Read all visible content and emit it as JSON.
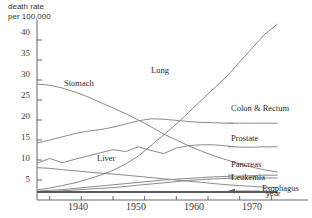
{
  "chart_data": {
    "type": "line",
    "title": "",
    "ylabel": "death rate\nper 100,000",
    "xlabel": "year",
    "xlim": [
      1933,
      1972
    ],
    "ylim": [
      0,
      44
    ],
    "grid": false,
    "legend_position": "inline-right",
    "yticks": [
      5,
      10,
      15,
      20,
      25,
      30,
      35,
      40
    ],
    "ytick_labels": [
      "5",
      "10",
      "15",
      "20",
      "25",
      "30",
      "35",
      "40"
    ],
    "xticks": [
      1935,
      1940,
      1945,
      1950,
      1955,
      1960,
      1965,
      1970
    ],
    "xtick_labels": [
      "",
      "1940",
      "",
      "1950",
      "",
      "1960",
      "",
      "1970"
    ],
    "x": [
      1933,
      1935,
      1937,
      1939,
      1941,
      1943,
      1945,
      1947,
      1949,
      1951,
      1953,
      1955,
      1957,
      1959,
      1961,
      1963,
      1965,
      1967,
      1969,
      1971
    ],
    "series": [
      {
        "name": "Lung",
        "label": "Lung",
        "values": [
          2.5,
          3.0,
          3.6,
          4.3,
          5.2,
          6.2,
          7.4,
          9.0,
          11.0,
          13.6,
          16.3,
          19.0,
          22.0,
          25.0,
          28.0,
          31.0,
          34.5,
          38.0,
          41.5,
          44.0
        ]
      },
      {
        "name": "Stomach",
        "label": "Stomach",
        "values": [
          29.0,
          28.7,
          28.0,
          27.0,
          25.8,
          24.4,
          23.0,
          21.6,
          20.0,
          18.3,
          16.5,
          15.0,
          13.5,
          12.2,
          11.0,
          10.0,
          9.0,
          8.2,
          7.5,
          7.0
        ]
      },
      {
        "name": "Colon & Rectum",
        "label": "Colon & Rectum",
        "values": [
          14.2,
          15.0,
          15.8,
          16.6,
          17.2,
          17.6,
          18.2,
          19.0,
          19.8,
          20.3,
          20.2,
          19.9,
          19.6,
          19.4,
          19.3,
          19.2,
          19.2,
          19.2,
          19.2,
          19.2
        ]
      },
      {
        "name": "Prostate",
        "label": "Prostate",
        "values": [
          9.2,
          10.4,
          9.3,
          10.2,
          11.0,
          11.8,
          12.6,
          12.1,
          13.3,
          12.4,
          11.6,
          13.0,
          13.6,
          13.8,
          13.8,
          13.5,
          13.2,
          13.2,
          13.3,
          13.3
        ]
      },
      {
        "name": "Liver",
        "label": "Liver",
        "values": [
          8.1,
          7.9,
          7.6,
          7.3,
          7.0,
          6.7,
          6.5,
          6.2,
          5.9,
          5.6,
          5.3,
          5.0,
          4.7,
          4.4,
          4.1,
          3.8,
          3.6,
          3.4,
          3.2,
          3.1
        ]
      },
      {
        "name": "Pancreas",
        "label": "Pancreas",
        "values": [
          2.2,
          2.4,
          2.6,
          2.9,
          3.2,
          3.5,
          3.8,
          4.1,
          4.4,
          4.7,
          5.0,
          5.2,
          5.4,
          5.6,
          5.8,
          5.9,
          6.0,
          6.1,
          6.2,
          6.2
        ]
      },
      {
        "name": "Leukemia",
        "label": "Leukemia",
        "values": [
          2.0,
          2.1,
          2.3,
          2.5,
          2.7,
          2.9,
          3.1,
          3.4,
          3.7,
          4.0,
          4.3,
          4.6,
          4.9,
          5.1,
          5.3,
          5.4,
          5.5,
          5.5,
          5.5,
          5.5
        ]
      },
      {
        "name": "Esophagus",
        "label": "Esophagus",
        "values": [
          2.0,
          2.0,
          2.0,
          2.0,
          2.0,
          2.0,
          2.0,
          2.0,
          2.0,
          2.0,
          2.0,
          2.0,
          2.0,
          2.0,
          2.0,
          2.0,
          2.0,
          2.0,
          2.0,
          2.0
        ]
      }
    ],
    "annotations": [
      {
        "name": "esophagus-pointer",
        "text": "",
        "target": "Esophagus"
      }
    ]
  },
  "labels": {
    "lung": "Lung",
    "stomach": "Stomach",
    "colon_rectum": "Colon & Rectum",
    "prostate": "Prostate",
    "liver": "Liver",
    "pancreas": "Pancreas",
    "leukemia": "Leukemia",
    "esophagus": "Esophagus",
    "year": "year",
    "ylabel_line1": "death rate",
    "ylabel_line2": "per 100,000"
  },
  "yticks": [
    "40",
    "35",
    "30",
    "25",
    "20",
    "15",
    "10",
    "5"
  ],
  "xticks": [
    "1940",
    "1950",
    "1960",
    "1970"
  ],
  "colors": {
    "line": "#8a8a8a",
    "line_dark": "#5a5a5a",
    "axis": "#555555",
    "text": "#2b2b2b"
  }
}
